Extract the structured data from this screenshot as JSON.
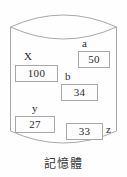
{
  "figure": {
    "caption": "記憶體",
    "shape_name": "cylinder",
    "colors": {
      "outline": "#a8a8a8",
      "text": "#2b2b2b",
      "background": "#fefefe",
      "cell_fill": "#fdfdfd"
    }
  },
  "memory_cells": [
    {
      "label": "X",
      "value": "100"
    },
    {
      "label": "a",
      "value": "50"
    },
    {
      "label": "b",
      "value": "34"
    },
    {
      "label": "y",
      "value": "27"
    },
    {
      "label": "z",
      "value": "33"
    }
  ]
}
